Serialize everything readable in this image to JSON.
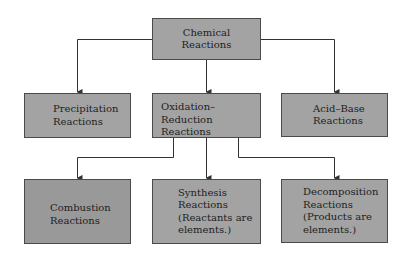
{
  "diagram": {
    "type": "hierarchy",
    "root": {
      "id": "chemical",
      "label": "Chemical\nReactions"
    },
    "level1": [
      {
        "id": "precipitation",
        "label": "Precipitation\nReactions"
      },
      {
        "id": "redox",
        "label": "Oxidation–Reduction\nReactions"
      },
      {
        "id": "acidbase",
        "label": "Acid–Base\nReactions"
      }
    ],
    "level2": [
      {
        "id": "combustion",
        "label": "Combustion\nReactions",
        "parent": "redox"
      },
      {
        "id": "synthesis",
        "label": "Synthesis\nReactions\n(Reactants are\nelements.)",
        "parent": "redox"
      },
      {
        "id": "decomposition",
        "label": "Decomposition\nReactions\n(Products are\nelements.)",
        "parent": "redox"
      }
    ],
    "edges": [
      [
        "chemical",
        "precipitation"
      ],
      [
        "chemical",
        "redox"
      ],
      [
        "chemical",
        "acidbase"
      ],
      [
        "redox",
        "combustion"
      ],
      [
        "redox",
        "synthesis"
      ],
      [
        "redox",
        "decomposition"
      ]
    ],
    "colors": {
      "box_fill": "#a3a3a3",
      "box_fill_dark": "#999999",
      "border": "#4a4a4a",
      "line": "#333333"
    }
  }
}
